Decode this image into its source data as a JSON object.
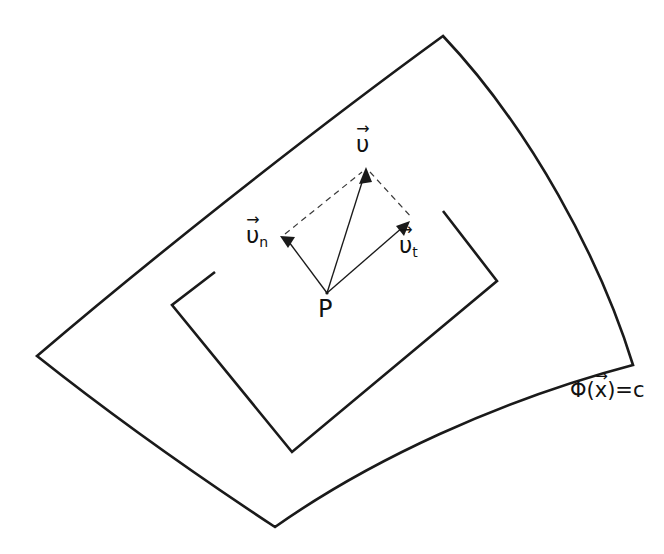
{
  "figure": {
    "background_color": "#ffffff",
    "stroke_color": "#1a1a1a",
    "dashed_stroke_color": "#3a3a3a"
  },
  "labels": {
    "velocity": {
      "symbol": "υ",
      "arrow": "→",
      "subscript": "",
      "name": "velocity vector"
    },
    "normal": {
      "symbol": "υ",
      "arrow": "→",
      "subscript": "n",
      "name": "normal component"
    },
    "tangent": {
      "symbol": "υ",
      "arrow": "→",
      "subscript": "t",
      "name": "tangential component"
    },
    "point": {
      "text": "P",
      "name": "point P"
    },
    "constraint": {
      "prefix": "Φ(",
      "symbol": "x",
      "arrow": "→",
      "suffix": ")=c",
      "full_text": "Φ(x⃗)=c",
      "name": "level surface equation"
    }
  },
  "geometry": {
    "origin_P": [
      327,
      293
    ],
    "tip_v": [
      366,
      168
    ],
    "tip_vn": [
      281,
      237
    ],
    "tip_vt": [
      409,
      222
    ],
    "surface_corners": {
      "top": [
        443,
        36
      ],
      "left": [
        37,
        356
      ],
      "right": [
        633,
        365
      ],
      "bottom": [
        275,
        527
      ]
    },
    "hole_corners": {
      "top_left": [
        215,
        272
      ],
      "left": [
        172,
        305
      ],
      "bottom": [
        292,
        452
      ],
      "right": [
        497,
        281
      ],
      "top_right": [
        443,
        211
      ]
    }
  }
}
